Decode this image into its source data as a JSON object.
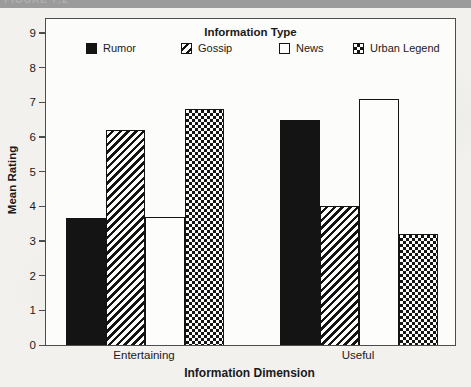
{
  "figure_header": {
    "label": "FIGURE 7.2"
  },
  "chart_data": {
    "type": "bar",
    "legend_title": "Information Type",
    "legend_position": "top-inside",
    "xlabel": "Information Dimension",
    "ylabel": "Mean Rating",
    "categories": [
      "Entertaining",
      "Useful"
    ],
    "series": [
      {
        "name": "Rumor",
        "pattern": "solid",
        "values": [
          3.65,
          6.5
        ]
      },
      {
        "name": "Gossip",
        "pattern": "stripes",
        "values": [
          6.2,
          4.0
        ]
      },
      {
        "name": "News",
        "pattern": "white",
        "values": [
          3.7,
          7.1
        ]
      },
      {
        "name": "Urban Legend",
        "pattern": "checker",
        "values": [
          6.8,
          3.2
        ]
      }
    ],
    "ylim": [
      0,
      9
    ],
    "yticks": [
      0,
      1,
      2,
      3,
      4,
      5,
      6,
      7,
      8,
      9
    ],
    "grid": false,
    "bar_color": "#141414",
    "layout": {
      "unit_px": 34.67,
      "bar_width_px": 39.5,
      "group_start_px": [
        20,
        234
      ],
      "legend_item_x_px": [
        40,
        135,
        233,
        307
      ],
      "category_center_px": [
        99,
        313
      ]
    }
  }
}
